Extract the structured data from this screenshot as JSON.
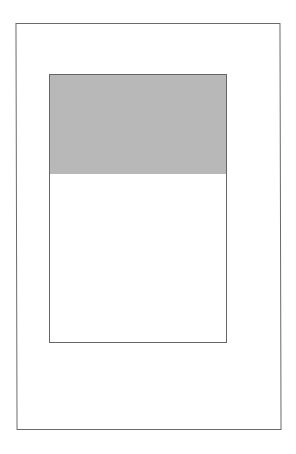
{
  "diagram": {
    "outer_frame": {
      "border_color": "#6a6a6a",
      "background": "#ffffff"
    },
    "inner_frame": {
      "border_color": "#666666",
      "background": "#ffffff"
    },
    "filled_region": {
      "color": "#b8b8b8",
      "fraction_of_inner_height": 0.37
    }
  }
}
